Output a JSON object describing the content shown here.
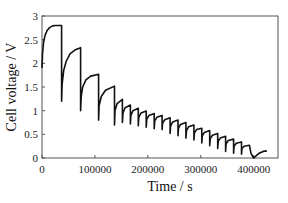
{
  "chart_data": {
    "type": "line",
    "title": "",
    "xlabel": "Time / s",
    "ylabel": "Cell voltage / V",
    "xlim": [
      0,
      446000
    ],
    "ylim": [
      0,
      3
    ],
    "xticks": [
      0,
      100000,
      200000,
      300000,
      400000
    ],
    "xtick_labels": [
      "0",
      "100000",
      "200000",
      "300000",
      "400000"
    ],
    "yticks": [
      0,
      0.5,
      1,
      1.5,
      2,
      2.5,
      3
    ],
    "ytick_labels": [
      "0",
      "0.5",
      "1",
      "1.5",
      "2",
      "2.5",
      "3"
    ],
    "grid": false,
    "legend": null,
    "series": [
      {
        "name": "Cell voltage",
        "color": "#111111",
        "x": [
          0,
          1000,
          3000,
          6000,
          10000,
          15000,
          20000,
          25000,
          37000,
          37000,
          38000,
          41000,
          46000,
          53000,
          62000,
          73000,
          73000,
          74000,
          77000,
          83000,
          92000,
          107000,
          107000,
          108000,
          112000,
          120000,
          137000,
          137000,
          138000,
          142000,
          152000,
          152000,
          153000,
          157000,
          167000,
          167000,
          168000,
          172000,
          182000,
          182000,
          183000,
          187000,
          197000,
          197000,
          198000,
          202000,
          212000,
          212000,
          213000,
          217000,
          227000,
          227000,
          228000,
          232000,
          242000,
          242000,
          243000,
          247000,
          257000,
          257000,
          258000,
          262000,
          272000,
          272000,
          273000,
          277000,
          287000,
          287000,
          288000,
          292000,
          302000,
          302000,
          303000,
          307000,
          317000,
          317000,
          318000,
          322000,
          332000,
          332000,
          333000,
          337000,
          347000,
          347000,
          348000,
          352000,
          362000,
          362000,
          363000,
          367000,
          377000,
          377000,
          378000,
          382000,
          392000,
          395000,
          400000,
          405000,
          410000,
          418000,
          425000
        ],
        "y": [
          1.9,
          2.2,
          2.45,
          2.6,
          2.7,
          2.76,
          2.79,
          2.8,
          2.8,
          1.2,
          1.55,
          1.85,
          2.05,
          2.2,
          2.28,
          2.33,
          1.0,
          1.3,
          1.5,
          1.65,
          1.73,
          1.77,
          0.8,
          1.1,
          1.3,
          1.43,
          1.52,
          0.7,
          1.0,
          1.15,
          1.24,
          0.75,
          0.95,
          1.06,
          1.12,
          0.72,
          0.9,
          1.0,
          1.05,
          0.68,
          0.86,
          0.95,
          0.99,
          0.65,
          0.82,
          0.9,
          0.94,
          0.62,
          0.78,
          0.86,
          0.9,
          0.6,
          0.74,
          0.81,
          0.85,
          0.52,
          0.68,
          0.76,
          0.8,
          0.47,
          0.63,
          0.71,
          0.75,
          0.42,
          0.58,
          0.66,
          0.7,
          0.38,
          0.53,
          0.6,
          0.63,
          0.32,
          0.47,
          0.54,
          0.58,
          0.26,
          0.41,
          0.48,
          0.52,
          0.2,
          0.35,
          0.42,
          0.46,
          0.14,
          0.3,
          0.37,
          0.4,
          0.1,
          0.25,
          0.31,
          0.34,
          0.08,
          0.2,
          0.25,
          0.27,
          0.1,
          0.0,
          0.05,
          0.1,
          0.14,
          0.15
        ]
      }
    ]
  },
  "layout": {
    "plot": {
      "left": 42,
      "right": 278,
      "top": 16,
      "bottom": 158
    },
    "axis_color": "#555555",
    "line_color": "#111111"
  }
}
